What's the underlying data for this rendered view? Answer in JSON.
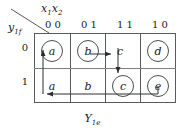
{
  "diagram": {
    "type": "karnaugh-map-state-transition",
    "column_variable_label": "x",
    "column_variable_sub1": "1",
    "column_variable_sub2": "x",
    "column_variable_sub3": "2",
    "column_header_text": "x₁x₂",
    "row_variable_text": "y",
    "row_variable_sub": "1f",
    "output_label_text": "Y",
    "output_label_sub": "1e",
    "columns": [
      {
        "label": "0 0"
      },
      {
        "label": "0 1"
      },
      {
        "label": "1 1"
      },
      {
        "label": "1 0"
      }
    ],
    "rows": [
      {
        "label": "0"
      },
      {
        "label": "1"
      }
    ],
    "cells": [
      {
        "row": 0,
        "col": 0,
        "letter": "a",
        "circled": true
      },
      {
        "row": 0,
        "col": 1,
        "letter": "b",
        "circled": true
      },
      {
        "row": 0,
        "col": 2,
        "letter": "c",
        "circled": false
      },
      {
        "row": 0,
        "col": 3,
        "letter": "d",
        "circled": true
      },
      {
        "row": 1,
        "col": 0,
        "letter": "a",
        "circled": false
      },
      {
        "row": 1,
        "col": 1,
        "letter": "b",
        "circled": false
      },
      {
        "row": 1,
        "col": 2,
        "letter": "c",
        "circled": true
      },
      {
        "row": 1,
        "col": 3,
        "letter": "e",
        "circled": true
      }
    ],
    "transitions": [
      {
        "name": "b-to-c-horizontal",
        "from": "b-row0",
        "to": "c-row0"
      },
      {
        "name": "c-down-to-c",
        "from": "c-row0",
        "to": "c-row1"
      },
      {
        "name": "e-to-a-horizontal",
        "from": "e-row1",
        "to": "a-row1"
      },
      {
        "name": "a-up-into-a",
        "from": "a-row1",
        "to": "a-row0"
      }
    ],
    "colors": {
      "line": "#555b5e",
      "inner_line": "#7a8084",
      "text": "#1a1a1a",
      "circle": "#4a5052",
      "arrow": "#2b2f31",
      "background": "#ffffff"
    }
  }
}
